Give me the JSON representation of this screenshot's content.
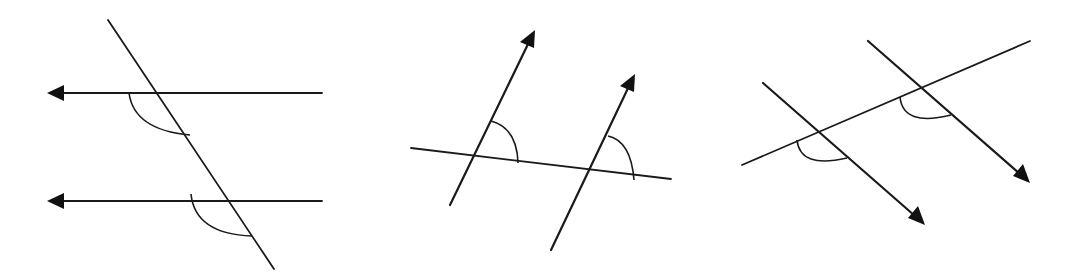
{
  "figure": {
    "colors": {
      "stroke": "#1a1a1a",
      "background": "#ffffff"
    },
    "diagrams": [
      {
        "id": "diagram-1",
        "parallel_lines": [
          {
            "x1": 322,
            "y1": 93,
            "x2": 50,
            "y2": 93,
            "arrow_at": "end",
            "arrow_direction": "left"
          },
          {
            "x1": 322,
            "y1": 201,
            "x2": 50,
            "y2": 201,
            "arrow_at": "end",
            "arrow_direction": "left"
          }
        ],
        "transversal": {
          "x1": 108,
          "y1": 20,
          "x2": 274,
          "y2": 269
        },
        "angle_arcs": [
          {
            "d": "M129,93 Q134,130 190,135"
          },
          {
            "d": "M191,194 Q195,234 252,236"
          }
        ]
      },
      {
        "id": "diagram-2",
        "parallel_lines": [
          {
            "x1": 450,
            "y1": 205,
            "x2": 532,
            "y2": 34,
            "arrow_at": "end",
            "arrow_direction": "up-right"
          },
          {
            "x1": 551,
            "y1": 250,
            "x2": 632,
            "y2": 78,
            "arrow_at": "end",
            "arrow_direction": "up-right"
          }
        ],
        "transversal": {
          "x1": 411,
          "y1": 148,
          "x2": 671,
          "y2": 179
        },
        "angle_arcs": [
          {
            "d": "M491,121 Q517,128 518,163"
          },
          {
            "d": "M608,136 Q631,141 634,180"
          }
        ]
      },
      {
        "id": "diagram-3",
        "parallel_lines": [
          {
            "x1": 763,
            "y1": 83,
            "x2": 921,
            "y2": 221,
            "arrow_at": "end",
            "arrow_direction": "down-right"
          },
          {
            "x1": 868,
            "y1": 41,
            "x2": 1026,
            "y2": 179,
            "arrow_at": "end",
            "arrow_direction": "down-right"
          }
        ],
        "transversal": {
          "x1": 742,
          "y1": 165,
          "x2": 1030,
          "y2": 41
        },
        "angle_arcs": [
          {
            "d": "M797,140 Q800,169 847,158"
          },
          {
            "d": "M900,97 Q903,127 951,115"
          }
        ]
      }
    ]
  }
}
